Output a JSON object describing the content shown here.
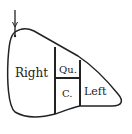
{
  "diagram": {
    "regions": [
      {
        "id": "right",
        "label": "Right"
      },
      {
        "id": "quadrate",
        "label": "Qu."
      },
      {
        "id": "caudate",
        "label": "C."
      },
      {
        "id": "left",
        "label": "Left"
      }
    ],
    "colors": {
      "stroke": "#222222",
      "background": "#ffffff"
    }
  }
}
